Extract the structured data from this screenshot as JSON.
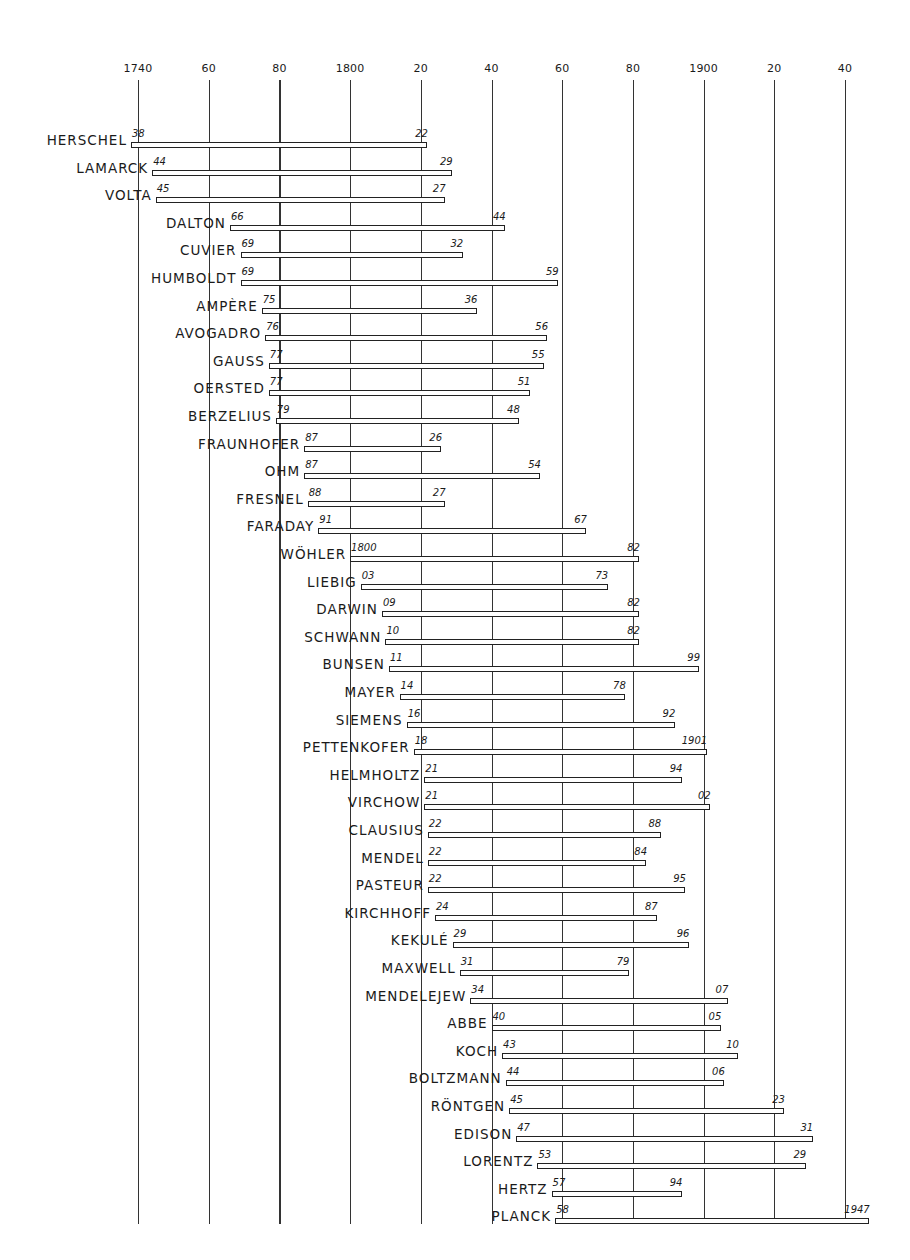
{
  "chart_data": {
    "type": "bar",
    "orientation": "horizontal-range",
    "title": "",
    "xlabel": "",
    "ylabel": "",
    "x_ticks": [
      1740,
      1760,
      1780,
      1800,
      1820,
      1840,
      1860,
      1880,
      1900,
      1920,
      1940
    ],
    "x_tick_labels": [
      "1740",
      "60",
      "80",
      "1800",
      "20",
      "40",
      "60",
      "80",
      "1900",
      "20",
      "40"
    ],
    "xlim": [
      1738,
      1948
    ],
    "grid": true,
    "series": [
      {
        "name": "HERSCHEL",
        "start": 1738,
        "end": 1822,
        "start_label": "38",
        "end_label": "22"
      },
      {
        "name": "LAMARCK",
        "start": 1744,
        "end": 1829,
        "start_label": "44",
        "end_label": "29"
      },
      {
        "name": "VOLTA",
        "start": 1745,
        "end": 1827,
        "start_label": "45",
        "end_label": "27"
      },
      {
        "name": "DALTON",
        "start": 1766,
        "end": 1844,
        "start_label": "66",
        "end_label": "44"
      },
      {
        "name": "CUVIER",
        "start": 1769,
        "end": 1832,
        "start_label": "69",
        "end_label": "32"
      },
      {
        "name": "HUMBOLDT",
        "start": 1769,
        "end": 1859,
        "start_label": "69",
        "end_label": "59"
      },
      {
        "name": "AMPÈRE",
        "start": 1775,
        "end": 1836,
        "start_label": "75",
        "end_label": "36"
      },
      {
        "name": "AVOGADRO",
        "start": 1776,
        "end": 1856,
        "start_label": "76",
        "end_label": "56"
      },
      {
        "name": "GAUSS",
        "start": 1777,
        "end": 1855,
        "start_label": "77",
        "end_label": "55"
      },
      {
        "name": "OERSTED",
        "start": 1777,
        "end": 1851,
        "start_label": "77",
        "end_label": "51"
      },
      {
        "name": "BERZELIUS",
        "start": 1779,
        "end": 1848,
        "start_label": "79",
        "end_label": "48"
      },
      {
        "name": "FRAUNHOFER",
        "start": 1787,
        "end": 1826,
        "start_label": "87",
        "end_label": "26"
      },
      {
        "name": "OHM",
        "start": 1787,
        "end": 1854,
        "start_label": "87",
        "end_label": "54"
      },
      {
        "name": "FRESNEL",
        "start": 1788,
        "end": 1827,
        "start_label": "88",
        "end_label": "27"
      },
      {
        "name": "FARADAY",
        "start": 1791,
        "end": 1867,
        "start_label": "91",
        "end_label": "67"
      },
      {
        "name": "WÖHLER",
        "start": 1800,
        "end": 1882,
        "start_label": "1800",
        "end_label": "82"
      },
      {
        "name": "LIEBIG",
        "start": 1803,
        "end": 1873,
        "start_label": "03",
        "end_label": "73"
      },
      {
        "name": "DARWIN",
        "start": 1809,
        "end": 1882,
        "start_label": "09",
        "end_label": "82"
      },
      {
        "name": "SCHWANN",
        "start": 1810,
        "end": 1882,
        "start_label": "10",
        "end_label": "82"
      },
      {
        "name": "BUNSEN",
        "start": 1811,
        "end": 1899,
        "start_label": "11",
        "end_label": "99"
      },
      {
        "name": "MAYER",
        "start": 1814,
        "end": 1878,
        "start_label": "14",
        "end_label": "78"
      },
      {
        "name": "SIEMENS",
        "start": 1816,
        "end": 1892,
        "start_label": "16",
        "end_label": "92"
      },
      {
        "name": "PETTENKOFER",
        "start": 1818,
        "end": 1901,
        "start_label": "18",
        "end_label": "1901"
      },
      {
        "name": "HELMHOLTZ",
        "start": 1821,
        "end": 1894,
        "start_label": "21",
        "end_label": "94"
      },
      {
        "name": "VIRCHOW",
        "start": 1821,
        "end": 1902,
        "start_label": "21",
        "end_label": "02"
      },
      {
        "name": "CLAUSIUS",
        "start": 1822,
        "end": 1888,
        "start_label": "22",
        "end_label": "88"
      },
      {
        "name": "MENDEL",
        "start": 1822,
        "end": 1884,
        "start_label": "22",
        "end_label": "84"
      },
      {
        "name": "PASTEUR",
        "start": 1822,
        "end": 1895,
        "start_label": "22",
        "end_label": "95"
      },
      {
        "name": "KIRCHHOFF",
        "start": 1824,
        "end": 1887,
        "start_label": "24",
        "end_label": "87"
      },
      {
        "name": "KEKULÉ",
        "start": 1829,
        "end": 1896,
        "start_label": "29",
        "end_label": "96"
      },
      {
        "name": "MAXWELL",
        "start": 1831,
        "end": 1879,
        "start_label": "31",
        "end_label": "79"
      },
      {
        "name": "MENDELEJEW",
        "start": 1834,
        "end": 1907,
        "start_label": "34",
        "end_label": "07"
      },
      {
        "name": "ABBE",
        "start": 1840,
        "end": 1905,
        "start_label": "40",
        "end_label": "05"
      },
      {
        "name": "KOCH",
        "start": 1843,
        "end": 1910,
        "start_label": "43",
        "end_label": "10"
      },
      {
        "name": "BOLTZMANN",
        "start": 1844,
        "end": 1906,
        "start_label": "44",
        "end_label": "06"
      },
      {
        "name": "RÖNTGEN",
        "start": 1845,
        "end": 1923,
        "start_label": "45",
        "end_label": "23"
      },
      {
        "name": "EDISON",
        "start": 1847,
        "end": 1931,
        "start_label": "47",
        "end_label": "31"
      },
      {
        "name": "LORENTZ",
        "start": 1853,
        "end": 1929,
        "start_label": "53",
        "end_label": "29"
      },
      {
        "name": "HERTZ",
        "start": 1857,
        "end": 1894,
        "start_label": "57",
        "end_label": "94"
      },
      {
        "name": "PLANCK",
        "start": 1858,
        "end": 1947,
        "start_label": "58",
        "end_label": "1947"
      }
    ]
  }
}
